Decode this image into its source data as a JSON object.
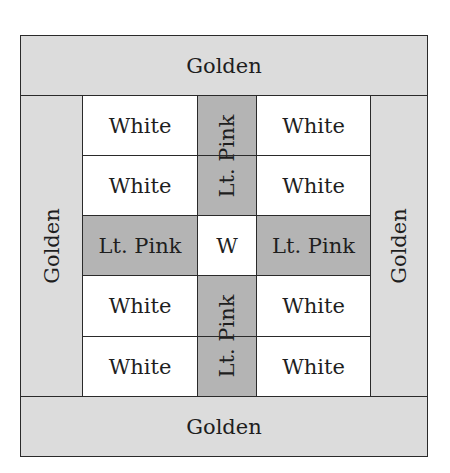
{
  "diagram": {
    "title": "",
    "type": "quilt block layout",
    "colors": {
      "golden": "#dcdcdc",
      "lt_pink": "#b4b4b4",
      "white": "#ffffff",
      "line": "#2a2a2a"
    },
    "border": {
      "top": "Golden",
      "bottom": "Golden",
      "left": "Golden",
      "right": "Golden"
    },
    "grid": {
      "rows": [
        [
          "White",
          "Lt. Pink",
          "White"
        ],
        [
          "White",
          "Lt. Pink",
          "White"
        ],
        [
          "Lt. Pink",
          "W",
          "Lt. Pink"
        ],
        [
          "White",
          "Lt. Pink",
          "White"
        ],
        [
          "White",
          "Lt. Pink",
          "White"
        ]
      ],
      "center_strip_top": "Lt. Pink",
      "center_strip_bottom": "Lt. Pink"
    }
  }
}
